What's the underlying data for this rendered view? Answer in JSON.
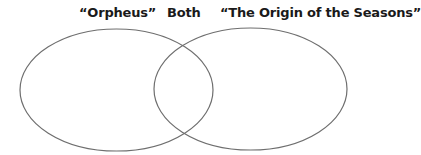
{
  "diagram": {
    "type": "venn",
    "labels": {
      "left": "“Orpheus”",
      "both": "Both",
      "right": "“The Origin of the Seasons”"
    },
    "sets": [
      {
        "name": "left-set",
        "label_ref": "left",
        "content": []
      },
      {
        "name": "overlap",
        "label_ref": "both",
        "content": []
      },
      {
        "name": "right-set",
        "label_ref": "right",
        "content": []
      }
    ],
    "stroke_color": "#6e6e6e",
    "background_color": "#ffffff"
  }
}
